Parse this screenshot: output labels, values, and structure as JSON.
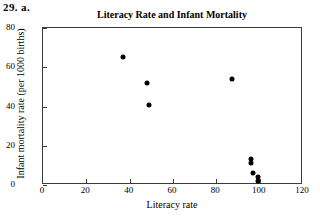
{
  "problem_label": "29. a.",
  "chart_data": {
    "type": "scatter",
    "title": "Literacy Rate and Infant Mortality",
    "xlabel": "Literacy rate",
    "ylabel": "Infant mortality rate (per 1000 births)",
    "xlim": [
      0,
      120
    ],
    "ylim": [
      0,
      80
    ],
    "xticks": [
      0,
      20,
      40,
      60,
      80,
      100,
      120
    ],
    "yticks": [
      0,
      20,
      40,
      60,
      80
    ],
    "grid": false,
    "legend": null,
    "marker": "filled-circle",
    "marker_color": "#000000",
    "points": [
      {
        "x": 37,
        "y": 65
      },
      {
        "x": 48,
        "y": 52
      },
      {
        "x": 49,
        "y": 41
      },
      {
        "x": 87,
        "y": 54
      },
      {
        "x": 96,
        "y": 13
      },
      {
        "x": 96,
        "y": 11
      },
      {
        "x": 97,
        "y": 6
      },
      {
        "x": 99,
        "y": 4
      },
      {
        "x": 99,
        "y": 2
      }
    ]
  }
}
